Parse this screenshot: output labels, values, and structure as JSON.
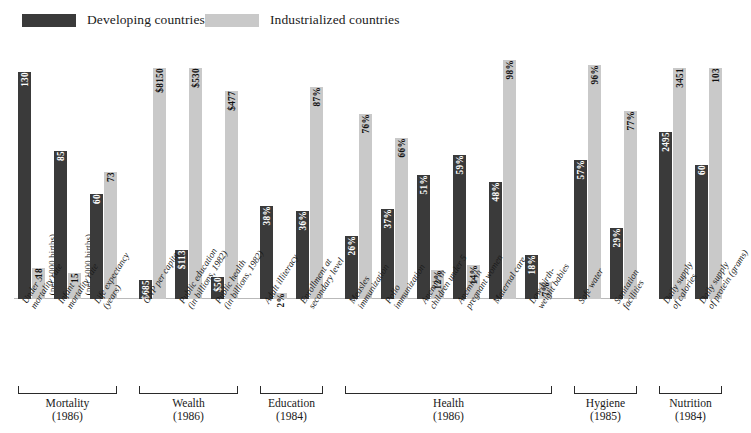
{
  "legend": {
    "developing": {
      "label": "Developing countries",
      "color": "#3a3a3a"
    },
    "industrialized": {
      "label": "Industrialized countries",
      "color": "#c9c9c9"
    }
  },
  "chart_data": {
    "type": "bar",
    "title": "",
    "xlabel": "",
    "ylabel": "",
    "grid": false,
    "legend_position": "top",
    "series": [
      {
        "name": "Developing countries",
        "color": "#3a3a3a"
      },
      {
        "name": "Industrialized countries",
        "color": "#c9c9c9"
      }
    ],
    "groups": [
      {
        "name": "Mortality",
        "year": "(1986)",
        "categories": [
          {
            "label": [
              "Under 5",
              "mortality rate"
            ],
            "unit": "(per 1000 births)",
            "developing": {
              "value": 130,
              "display": "130"
            },
            "industrialized": {
              "value": 18,
              "display": "18"
            },
            "scale_max": 140
          },
          {
            "label": [
              "Infant",
              "mortality rate"
            ],
            "unit": "(per 1000 births)",
            "developing": {
              "value": 85,
              "display": "85"
            },
            "industrialized": {
              "value": 15,
              "display": "15"
            },
            "scale_max": 140
          },
          {
            "label": [
              "Life expectancy",
              "(years)"
            ],
            "unit": "",
            "developing": {
              "value": 60,
              "display": "60"
            },
            "industrialized": {
              "value": 73,
              "display": "73"
            },
            "scale_max": 140
          }
        ]
      },
      {
        "name": "Wealth",
        "year": "(1986)",
        "categories": [
          {
            "label": [
              "GNP per capita"
            ],
            "unit": "",
            "developing": {
              "value": 685,
              "display": "$685"
            },
            "industrialized": {
              "value": 8150,
              "display": "$8150"
            },
            "scale_max": 8600
          },
          {
            "label": [
              "Public education",
              "(in billions, 1982)"
            ],
            "unit": "",
            "developing": {
              "value": 113,
              "display": "$113"
            },
            "industrialized": {
              "value": 530,
              "display": "$530"
            },
            "scale_max": 560
          },
          {
            "label": [
              "Public health",
              "(in billions, 1982)"
            ],
            "unit": "",
            "developing": {
              "value": 50,
              "display": "$50"
            },
            "industrialized": {
              "value": 477,
              "display": "$477"
            },
            "scale_max": 560
          }
        ]
      },
      {
        "name": "Education",
        "year": "(1984)",
        "categories": [
          {
            "label": [
              "Adult illiteracy"
            ],
            "unit": "",
            "developing": {
              "value": 38,
              "display": "38%"
            },
            "industrialized": {
              "value": 2,
              "display": "2%"
            },
            "scale_max": 100
          },
          {
            "label": [
              "Enrollment at",
              "secondary level"
            ],
            "unit": "",
            "developing": {
              "value": 36,
              "display": "36%"
            },
            "industrialized": {
              "value": 87,
              "display": "87%"
            },
            "scale_max": 100
          }
        ]
      },
      {
        "name": "Health",
        "year": "(1986)",
        "categories": [
          {
            "label": [
              "Measles",
              "immunization"
            ],
            "unit": "",
            "developing": {
              "value": 26,
              "display": "26%"
            },
            "industrialized": {
              "value": 76,
              "display": "76%"
            },
            "scale_max": 100
          },
          {
            "label": [
              "Polio",
              "immunization"
            ],
            "unit": "",
            "developing": {
              "value": 37,
              "display": "37%"
            },
            "industrialized": {
              "value": 66,
              "display": "66%"
            },
            "scale_max": 100
          },
          {
            "label": [
              "Anemia in",
              "children under 5"
            ],
            "unit": "",
            "developing": {
              "value": 51,
              "display": "51%"
            },
            "industrialized": {
              "value": 12,
              "display": "12%"
            },
            "scale_max": 100
          },
          {
            "label": [
              "Anemia in",
              "pregnant women"
            ],
            "unit": "",
            "developing": {
              "value": 59,
              "display": "59%"
            },
            "industrialized": {
              "value": 14,
              "display": "14%"
            },
            "scale_max": 100
          },
          {
            "label": [
              "Maternal care"
            ],
            "unit": "",
            "developing": {
              "value": 48,
              "display": "48%"
            },
            "industrialized": {
              "value": 98,
              "display": "98%"
            },
            "scale_max": 100
          },
          {
            "label": [
              "Low-birth-",
              "weight babies"
            ],
            "unit": "",
            "developing": {
              "value": 18,
              "display": "18%"
            },
            "industrialized": {
              "value": 7,
              "display": "7%"
            },
            "scale_max": 100
          }
        ]
      },
      {
        "name": "Hygiene",
        "year": "(1985)",
        "categories": [
          {
            "label": [
              "Safe water"
            ],
            "unit": "",
            "developing": {
              "value": 57,
              "display": "57%"
            },
            "industrialized": {
              "value": 96,
              "display": "96%"
            },
            "scale_max": 100
          },
          {
            "label": [
              "Sanitation",
              "facilities"
            ],
            "unit": "",
            "developing": {
              "value": 29,
              "display": "29%"
            },
            "industrialized": {
              "value": 77,
              "display": "77%"
            },
            "scale_max": 100
          }
        ]
      },
      {
        "name": "Nutrition",
        "year": "(1984)",
        "categories": [
          {
            "label": [
              "Daily supply",
              "of calories"
            ],
            "unit": "",
            "developing": {
              "value": 2495,
              "display": "2495"
            },
            "industrialized": {
              "value": 3451,
              "display": "3451"
            },
            "scale_max": 3650
          },
          {
            "label": [
              "Daily supply",
              "of protein (grams)"
            ],
            "unit": "",
            "developing": {
              "value": 60,
              "display": "60"
            },
            "industrialized": {
              "value": 103,
              "display": "103"
            },
            "scale_max": 109
          }
        ]
      }
    ]
  }
}
